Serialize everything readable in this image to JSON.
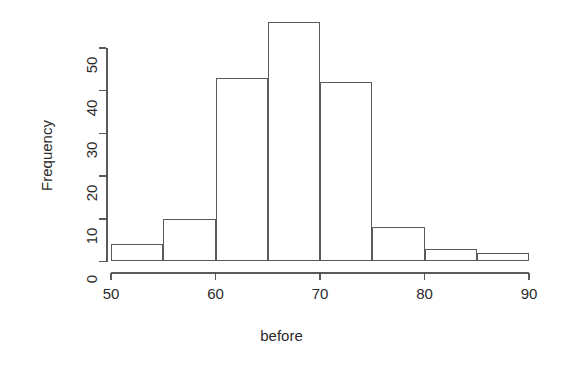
{
  "chart_data": {
    "type": "bar",
    "subtype": "histogram",
    "title": "",
    "xlabel": "before",
    "ylabel": "Frequency",
    "bin_width": 5,
    "bin_edges": [
      50,
      55,
      60,
      65,
      70,
      75,
      80,
      85,
      90
    ],
    "categories": [
      "50-55",
      "55-60",
      "60-65",
      "65-70",
      "70-75",
      "75-80",
      "80-85",
      "85-90"
    ],
    "bin_starts": [
      50,
      55,
      60,
      65,
      70,
      75,
      80,
      85
    ],
    "values": [
      4,
      10,
      43,
      56,
      42,
      8,
      3,
      2
    ],
    "xlim": [
      50,
      90
    ],
    "ylim": [
      0,
      56
    ],
    "x_ticks": [
      50,
      60,
      70,
      80,
      90
    ],
    "x_tick_labels": [
      "50",
      "60",
      "70",
      "80",
      "90"
    ],
    "y_ticks": [
      0,
      10,
      20,
      30,
      40,
      50
    ],
    "y_tick_labels": [
      "0",
      "10",
      "20",
      "30",
      "40",
      "50"
    ],
    "grid": false,
    "legend": false,
    "bar_fill": "#ffffff",
    "bar_stroke": "#5a5a5a",
    "axis_color": "#5a5a5a",
    "text_color": "#2b2b2b",
    "background": "#ffffff"
  },
  "axes": {
    "y_title": "Frequency",
    "x_title": "before"
  }
}
